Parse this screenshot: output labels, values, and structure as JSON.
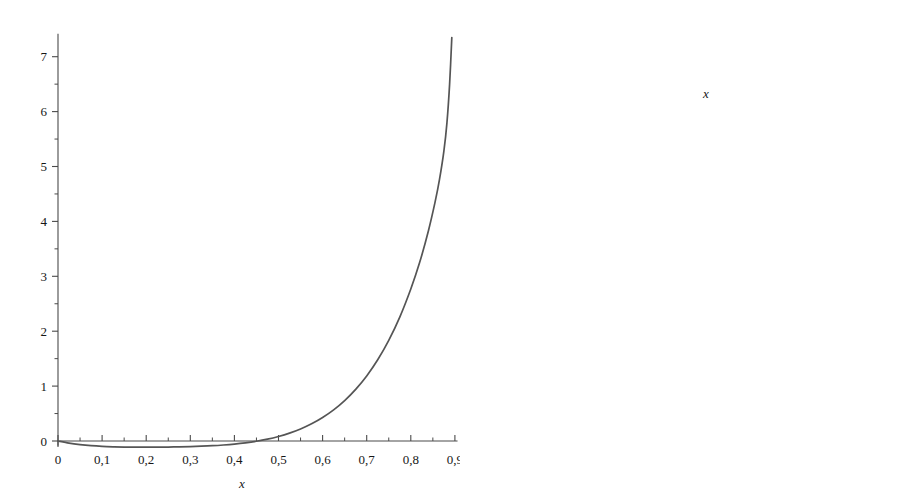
{
  "figure": {
    "background": "#ffffff",
    "curve_color": "#555555",
    "axis_color": "#4a4a4a",
    "width": 919,
    "height": 500
  },
  "chart_data": [
    {
      "id": "left-plot",
      "type": "line",
      "title": "",
      "subtitle": "",
      "xlabel": "x",
      "ylabel": "",
      "xlim": [
        0,
        0.9
      ],
      "ylim": [
        -0.12,
        7.4
      ],
      "grid": false,
      "legend": null,
      "annotations": [],
      "decimal_separator": ",",
      "xticks": [
        0,
        0.1,
        0.2,
        0.3,
        0.4,
        0.5,
        0.6,
        0.7,
        0.8,
        0.9
      ],
      "xticklabels": [
        "0",
        "0,1",
        "0,2",
        "0,3",
        "0,4",
        "0,5",
        "0,6",
        "0,7",
        "0,8",
        "0,9"
      ],
      "xminorticks": [
        0.05,
        0.15,
        0.25,
        0.35,
        0.45,
        0.55,
        0.65,
        0.75,
        0.85
      ],
      "yticks": [
        0,
        1,
        2,
        3,
        4,
        5,
        6,
        7
      ],
      "yticklabels": [
        "0",
        "1",
        "2",
        "3",
        "4",
        "5",
        "6",
        "7"
      ],
      "yminorticks": [
        0.5,
        1.5,
        2.5,
        3.5,
        4.5,
        5.5,
        6.5
      ],
      "series": [
        {
          "name": "f(x)",
          "x": [
            0.0,
            0.025,
            0.05,
            0.075,
            0.1,
            0.125,
            0.15,
            0.175,
            0.2,
            0.225,
            0.25,
            0.275,
            0.3,
            0.325,
            0.35,
            0.375,
            0.4,
            0.425,
            0.45,
            0.475,
            0.5,
            0.525,
            0.55,
            0.575,
            0.6,
            0.625,
            0.65,
            0.675,
            0.7,
            0.725,
            0.75,
            0.775,
            0.8,
            0.82,
            0.84,
            0.855,
            0.865,
            0.875,
            0.882,
            0.888,
            0.893
          ],
          "y": [
            0.0,
            -0.038,
            -0.065,
            -0.085,
            -0.098,
            -0.106,
            -0.111,
            -0.113,
            -0.113,
            -0.112,
            -0.11,
            -0.107,
            -0.102,
            -0.095,
            -0.086,
            -0.073,
            -0.056,
            -0.034,
            -0.005,
            0.033,
            0.082,
            0.143,
            0.219,
            0.313,
            0.428,
            0.568,
            0.737,
            0.941,
            1.186,
            1.48,
            1.833,
            2.258,
            2.77,
            3.25,
            3.83,
            4.35,
            4.76,
            5.28,
            5.8,
            6.5,
            7.35
          ]
        }
      ]
    },
    {
      "id": "right-plot",
      "type": "line",
      "title": "",
      "subtitle": "",
      "xlabel": "x",
      "ylabel": "",
      "xlim": [
        0,
        0.47
      ],
      "ylim": [
        -0.118,
        0.008
      ],
      "grid": false,
      "legend": null,
      "annotations": [],
      "decimal_separator": ",",
      "xticks": [
        0.1,
        0.2,
        0.3,
        0.4
      ],
      "xticklabels": [
        "0,1",
        "0,2",
        "0,3",
        "0,4"
      ],
      "xminorticks": [
        0.05,
        0.15,
        0.25,
        0.35,
        0.45
      ],
      "yticks": [
        0,
        -0.02,
        -0.04,
        -0.06,
        -0.08,
        -0.1
      ],
      "yticklabels": [
        "0",
        "−0,02",
        "−0,04",
        "−0,06",
        "−0,08",
        "−0,10"
      ],
      "yminorticks": [
        -0.01,
        -0.03,
        -0.05,
        -0.07,
        -0.09,
        -0.11
      ],
      "series": [
        {
          "name": "f(x)",
          "x": [
            0.0,
            0.01,
            0.02,
            0.03,
            0.04,
            0.05,
            0.06,
            0.07,
            0.08,
            0.09,
            0.1,
            0.12,
            0.14,
            0.16,
            0.18,
            0.2,
            0.22,
            0.24,
            0.26,
            0.28,
            0.29,
            0.3,
            0.31,
            0.32,
            0.34,
            0.36,
            0.38,
            0.4,
            0.415,
            0.43,
            0.44,
            0.45,
            0.458,
            0.464,
            0.469
          ],
          "y": [
            0.0,
            -0.0046,
            -0.009,
            -0.0133,
            -0.0175,
            -0.0215,
            -0.0254,
            -0.0292,
            -0.0329,
            -0.0364,
            -0.0398,
            -0.0463,
            -0.0524,
            -0.0581,
            -0.0634,
            -0.0684,
            -0.073,
            -0.0772,
            -0.081,
            -0.084,
            -0.0851,
            -0.0858,
            -0.0861,
            -0.086,
            -0.0845,
            -0.081,
            -0.0752,
            -0.0665,
            -0.058,
            -0.047,
            -0.0375,
            -0.026,
            -0.0145,
            -0.004,
            0.006
          ]
        }
      ]
    }
  ],
  "left_plot_geometry": {
    "origin_x": 58,
    "origin_y": 441,
    "px_per_x": 441,
    "px_per_y": 54.9
  },
  "right_plot_geometry": {
    "origin_x": 548,
    "origin_y": 55,
    "px_per_x": 716,
    "px_per_y": 3400
  }
}
